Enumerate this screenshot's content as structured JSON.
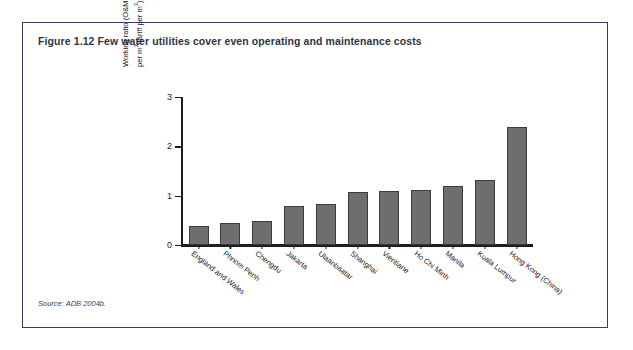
{
  "figure": {
    "title": "Figure 1.12  Few water utilities cover even operating and maintenance costs",
    "source": "Source: ADB 2004b."
  },
  "axis": {
    "ylabel_line1": "Working ratio (O&M costs",
    "ylabel_line2_a": "per m",
    "ylabel_line2_b": "3",
    "ylabel_line2_c": "/tariff per m",
    "ylabel_line2_d": "3",
    "ylabel_line2_e": "), selected utilities",
    "yticks": [
      "0",
      "1",
      "2",
      "3"
    ]
  },
  "chart_data": {
    "type": "bar",
    "title": "Few water utilities cover even operating and maintenance costs",
    "xlabel": "",
    "ylabel": "Working ratio (O&M costs per m3/tariff per m3), selected utilities",
    "ylim": [
      0,
      3
    ],
    "yticks": [
      0,
      1,
      2,
      3
    ],
    "grid": false,
    "legend": false,
    "bar_color": "#6e6e6e",
    "bar_edge_color": "#3c3c3c",
    "categories": [
      "England and Wales",
      "Phnom Penh",
      "Chengdu",
      "Jakarta",
      "Ulaanbaatar",
      "Shanghai",
      "Vientiane",
      "Ho Chi Minh",
      "Manila",
      "Kuala Lumpur",
      "Hong Kong (China)"
    ],
    "values": [
      0.39,
      0.44,
      0.48,
      0.8,
      0.83,
      1.08,
      1.1,
      1.11,
      1.19,
      1.31,
      2.4
    ]
  }
}
